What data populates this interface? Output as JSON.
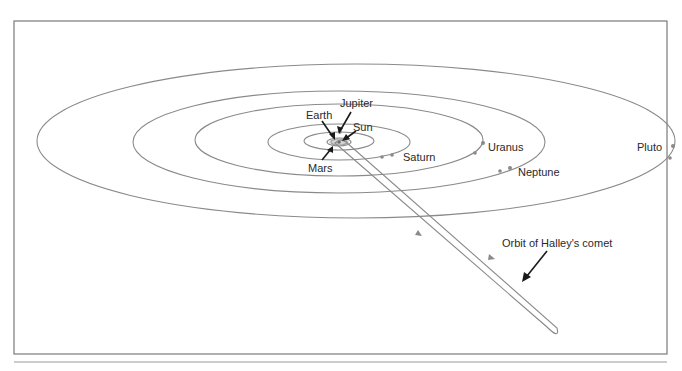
{
  "figure": {
    "labels": {
      "jupiter": "Jupiter",
      "earth": "Earth",
      "sun": "Sun",
      "mars": "Mars",
      "saturn": "Saturn",
      "uranus": "Uranus",
      "neptune": "Neptune",
      "pluto": "Pluto",
      "halley": "Orbit of Halley's comet"
    },
    "colors": {
      "orbit": "#8a8a8a",
      "arrow": "#1a1a1a",
      "text": "#2a2a2a",
      "frame": "#7a7a7a"
    },
    "orbits": [
      {
        "name": "Pluto",
        "cx": 356,
        "cy": 141,
        "rx": 319,
        "ry": 77
      },
      {
        "name": "Neptune",
        "cx": 339,
        "cy": 142,
        "rx": 206,
        "ry": 51
      },
      {
        "name": "Uranus",
        "cx": 339,
        "cy": 140,
        "rx": 144,
        "ry": 36
      },
      {
        "name": "Saturn",
        "cx": 339,
        "cy": 142,
        "rx": 71,
        "ry": 18
      },
      {
        "name": "Jupiter",
        "cx": 339,
        "cy": 141,
        "rx": 35,
        "ry": 9
      },
      {
        "name": "Mars",
        "cx": 339,
        "cy": 142,
        "rx": 12,
        "ry": 4
      },
      {
        "name": "Earth",
        "cx": 339,
        "cy": 142,
        "rx": 8,
        "ry": 3
      }
    ]
  }
}
